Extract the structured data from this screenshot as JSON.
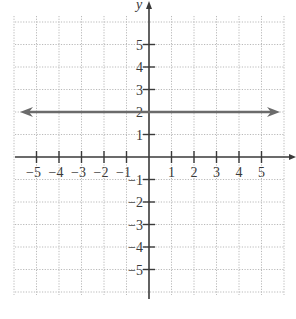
{
  "chart_data": {
    "type": "line",
    "title": "",
    "xlabel": "",
    "ylabel": "y",
    "xlim": [
      -6,
      6
    ],
    "ylim": [
      -6,
      6
    ],
    "grid": true,
    "grid_style": "dotted",
    "x_ticks": [
      -5,
      -4,
      -3,
      -2,
      -1,
      1,
      2,
      3,
      4,
      5
    ],
    "y_ticks": [
      5,
      4,
      3,
      2,
      1,
      -1,
      -2,
      -3,
      -4,
      -5
    ],
    "x_tick_labels": [
      "−5",
      "−4",
      "−3",
      "−2",
      "−1",
      "1",
      "2",
      "3",
      "4",
      "5"
    ],
    "y_tick_labels": [
      "5",
      "4",
      "3",
      "2",
      "1",
      "−1",
      "−2",
      "−3",
      "−4",
      "−5"
    ],
    "series": [
      {
        "name": "y = 2",
        "equation": "y = 2",
        "x": [
          -6,
          6
        ],
        "y": [
          2,
          2
        ],
        "arrows": "both",
        "color": "#6b6b6b"
      }
    ],
    "legend": null
  },
  "colors": {
    "axis": "#3a3a3a",
    "grid": "#b9b9b9",
    "line": "#6b6b6b",
    "background": "#ffffff"
  }
}
